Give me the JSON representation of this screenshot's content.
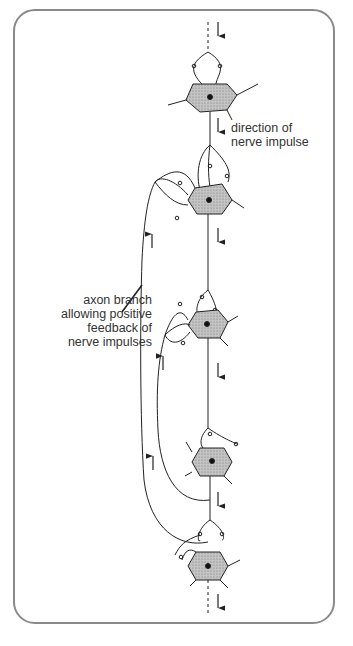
{
  "diagram": {
    "labels": {
      "direction_line1": "direction of",
      "direction_line2": "nerve impulse",
      "axon_line1": "axon branch",
      "axon_line2": "allowing positive",
      "axon_line3": "feedback of",
      "axon_line4": "nerve impulses"
    },
    "neurons": [
      {
        "id": 1,
        "cx": 210,
        "cy": 93
      },
      {
        "id": 2,
        "cx": 208,
        "cy": 200
      },
      {
        "id": 3,
        "cx": 206,
        "cy": 323
      },
      {
        "id": 4,
        "cx": 212,
        "cy": 462
      },
      {
        "id": 5,
        "cx": 208,
        "cy": 566
      }
    ],
    "colors": {
      "line": "#222222",
      "soma_fill": "#b8b8b8",
      "frame": "#8a8a8a"
    }
  }
}
